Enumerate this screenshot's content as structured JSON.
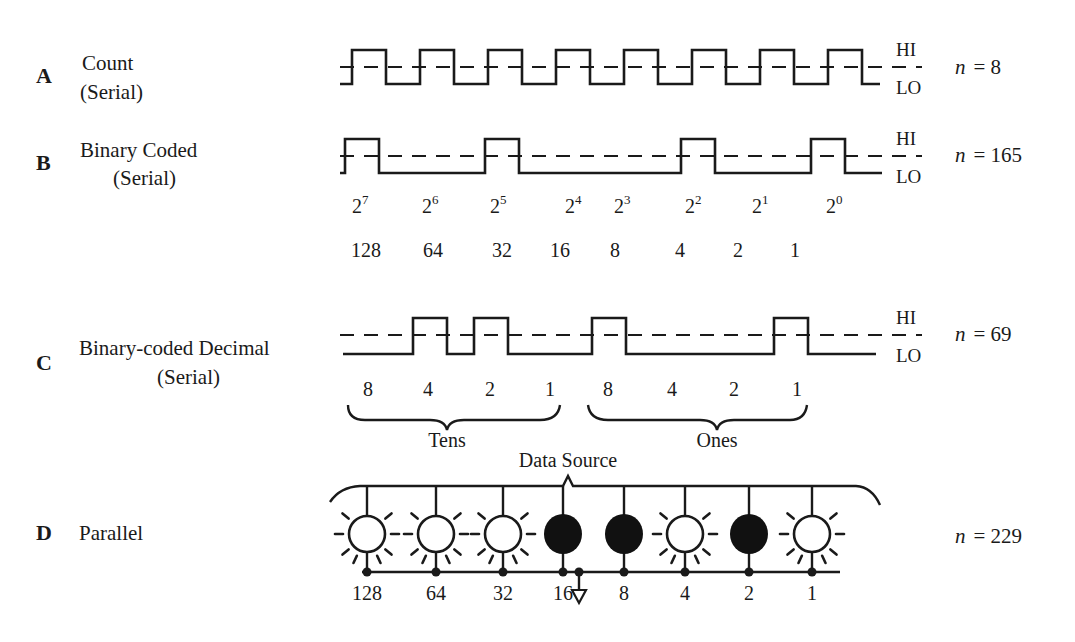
{
  "rows": [
    {
      "letter": "A",
      "title_line1": "Count",
      "title_line2": "(Serial)",
      "hi_label": "HI",
      "lo_label": "LO",
      "n_var": "n",
      "n_eq": "= 8",
      "waveform": "pulse-train",
      "bits": [
        1,
        1,
        1,
        1,
        1,
        1,
        1,
        1
      ]
    },
    {
      "letter": "B",
      "title_line1": "Binary Coded",
      "title_line2": "(Serial)",
      "hi_label": "HI",
      "lo_label": "LO",
      "n_var": "n",
      "n_eq": "= 165",
      "waveform": "binary",
      "bits": [
        1,
        0,
        1,
        0,
        0,
        1,
        0,
        1
      ],
      "powers": [
        {
          "base": "2",
          "exp": "7"
        },
        {
          "base": "2",
          "exp": "6"
        },
        {
          "base": "2",
          "exp": "5"
        },
        {
          "base": "2",
          "exp": "4"
        },
        {
          "base": "2",
          "exp": "3"
        },
        {
          "base": "2",
          "exp": "2"
        },
        {
          "base": "2",
          "exp": "1"
        },
        {
          "base": "2",
          "exp": "0"
        }
      ],
      "weights": [
        "128",
        "64",
        "32",
        "16",
        "8",
        "4",
        "2",
        "1"
      ]
    },
    {
      "letter": "C",
      "title_line1": "Binary-coded Decimal",
      "title_line2": "(Serial)",
      "hi_label": "HI",
      "lo_label": "LO",
      "n_var": "n",
      "n_eq": "= 69",
      "waveform": "bcd",
      "bits": [
        0,
        1,
        1,
        0,
        1,
        0,
        0,
        1
      ],
      "weights": [
        "8",
        "4",
        "2",
        "1",
        "8",
        "4",
        "2",
        "1"
      ],
      "groups": [
        "Tens",
        "Ones"
      ]
    },
    {
      "letter": "D",
      "title_line1": "Parallel",
      "n_var": "n",
      "n_eq": "= 229",
      "source_label": "Data Source",
      "lamps_lit": [
        1,
        1,
        1,
        0,
        0,
        1,
        0,
        1
      ],
      "weights": [
        "128",
        "64",
        "32",
        "16",
        "8",
        "4",
        "2",
        "1"
      ]
    }
  ]
}
